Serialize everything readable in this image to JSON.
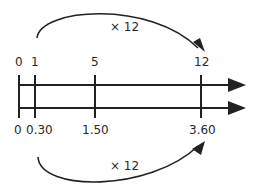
{
  "diagram": {
    "type": "double-number-line",
    "top_line": {
      "ticks": [
        {
          "label": "0",
          "x": 19
        },
        {
          "label": "1",
          "x": 35
        },
        {
          "label": "5",
          "x": 95
        },
        {
          "label": "12",
          "x": 201
        }
      ]
    },
    "bottom_line": {
      "ticks": [
        {
          "label": "0",
          "x": 19
        },
        {
          "label": "0.30",
          "x": 35
        },
        {
          "label": "1.50",
          "x": 95
        },
        {
          "label": "3.60",
          "x": 201
        }
      ]
    },
    "top_arrow": {
      "label": "× 12",
      "from": "1",
      "to": "12"
    },
    "bottom_arrow": {
      "label": "× 12",
      "from": "0.30",
      "to": "3.60"
    },
    "colors": {
      "stroke": "#222222",
      "text": "#2a2a2a"
    }
  }
}
